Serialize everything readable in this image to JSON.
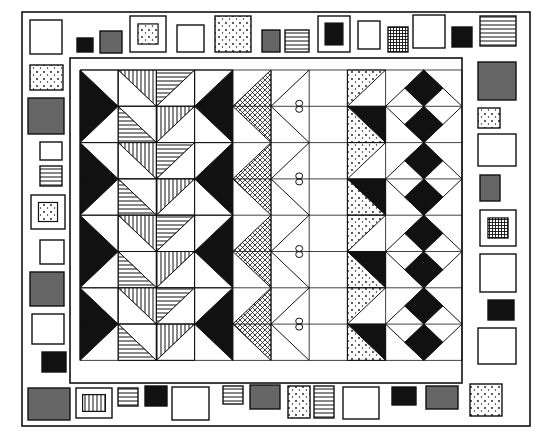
{
  "artwork": {
    "subject": "hand-drawn quilt illustration",
    "colors": {
      "ink": "#111111",
      "gray": "#666666",
      "paper": "#ffffff"
    },
    "border_patches": {
      "top": [
        {
          "x": 30,
          "y": 20,
          "w": 32,
          "h": 34,
          "fill": "white"
        },
        {
          "x": 77,
          "y": 38,
          "w": 16,
          "h": 14,
          "fill": "black"
        },
        {
          "x": 100,
          "y": 31,
          "w": 22,
          "h": 22,
          "fill": "gray"
        },
        {
          "x": 130,
          "y": 16,
          "w": 36,
          "h": 36,
          "fill": "white",
          "inner": "dots"
        },
        {
          "x": 177,
          "y": 25,
          "w": 27,
          "h": 27,
          "fill": "white"
        },
        {
          "x": 215,
          "y": 16,
          "w": 36,
          "h": 36,
          "fill": "dots"
        },
        {
          "x": 262,
          "y": 30,
          "w": 18,
          "h": 22,
          "fill": "gray"
        },
        {
          "x": 285,
          "y": 30,
          "w": 24,
          "h": 22,
          "fill": "hstripes"
        },
        {
          "x": 318,
          "y": 16,
          "w": 32,
          "h": 36,
          "fill": "white",
          "inner": "black"
        },
        {
          "x": 358,
          "y": 21,
          "w": 22,
          "h": 28,
          "fill": "white"
        },
        {
          "x": 388,
          "y": 27,
          "w": 20,
          "h": 25,
          "fill": "grid"
        },
        {
          "x": 413,
          "y": 15,
          "w": 32,
          "h": 33,
          "fill": "white"
        },
        {
          "x": 452,
          "y": 27,
          "w": 20,
          "h": 20,
          "fill": "black"
        },
        {
          "x": 480,
          "y": 16,
          "w": 36,
          "h": 30,
          "fill": "hstripes"
        }
      ],
      "left": [
        {
          "x": 30,
          "y": 65,
          "w": 33,
          "h": 25,
          "fill": "dots"
        },
        {
          "x": 28,
          "y": 98,
          "w": 36,
          "h": 36,
          "fill": "gray"
        },
        {
          "x": 40,
          "y": 142,
          "w": 22,
          "h": 18,
          "fill": "white"
        },
        {
          "x": 40,
          "y": 166,
          "w": 22,
          "h": 20,
          "fill": "hstripes"
        },
        {
          "x": 31,
          "y": 195,
          "w": 34,
          "h": 34,
          "fill": "white",
          "inner": "dots-gray"
        },
        {
          "x": 40,
          "y": 240,
          "w": 24,
          "h": 24,
          "fill": "white"
        },
        {
          "x": 30,
          "y": 272,
          "w": 34,
          "h": 34,
          "fill": "gray"
        },
        {
          "x": 32,
          "y": 314,
          "w": 32,
          "h": 30,
          "fill": "white"
        },
        {
          "x": 42,
          "y": 352,
          "w": 24,
          "h": 20,
          "fill": "black"
        }
      ],
      "right": [
        {
          "x": 478,
          "y": 62,
          "w": 38,
          "h": 38,
          "fill": "gray"
        },
        {
          "x": 478,
          "y": 108,
          "w": 22,
          "h": 20,
          "fill": "dots"
        },
        {
          "x": 478,
          "y": 134,
          "w": 38,
          "h": 32,
          "fill": "white"
        },
        {
          "x": 480,
          "y": 175,
          "w": 20,
          "h": 26,
          "fill": "gray"
        },
        {
          "x": 480,
          "y": 210,
          "w": 36,
          "h": 36,
          "fill": "white",
          "inner": "grid"
        },
        {
          "x": 480,
          "y": 254,
          "w": 36,
          "h": 38,
          "fill": "white"
        },
        {
          "x": 488,
          "y": 300,
          "w": 26,
          "h": 20,
          "fill": "black"
        },
        {
          "x": 478,
          "y": 328,
          "w": 38,
          "h": 36,
          "fill": "white"
        }
      ],
      "bottom": [
        {
          "x": 28,
          "y": 388,
          "w": 42,
          "h": 32,
          "fill": "gray"
        },
        {
          "x": 76,
          "y": 388,
          "w": 36,
          "h": 30,
          "fill": "white",
          "inner": "vstripes"
        },
        {
          "x": 118,
          "y": 388,
          "w": 20,
          "h": 18,
          "fill": "hstripes"
        },
        {
          "x": 145,
          "y": 386,
          "w": 22,
          "h": 20,
          "fill": "black"
        },
        {
          "x": 172,
          "y": 387,
          "w": 37,
          "h": 33,
          "fill": "white"
        },
        {
          "x": 223,
          "y": 386,
          "w": 20,
          "h": 18,
          "fill": "hstripes"
        },
        {
          "x": 250,
          "y": 385,
          "w": 30,
          "h": 24,
          "fill": "gray"
        },
        {
          "x": 288,
          "y": 386,
          "w": 22,
          "h": 32,
          "fill": "dots"
        },
        {
          "x": 314,
          "y": 386,
          "w": 20,
          "h": 32,
          "fill": "hstripes"
        },
        {
          "x": 343,
          "y": 387,
          "w": 36,
          "h": 32,
          "fill": "white"
        },
        {
          "x": 392,
          "y": 387,
          "w": 24,
          "h": 18,
          "fill": "black"
        },
        {
          "x": 426,
          "y": 386,
          "w": 32,
          "h": 23,
          "fill": "gray"
        },
        {
          "x": 470,
          "y": 384,
          "w": 32,
          "h": 32,
          "fill": "dots"
        }
      ]
    },
    "center_panel": {
      "frame": {
        "x": 70,
        "y": 58,
        "w": 392,
        "h": 325
      },
      "grid": {
        "x": 80,
        "y": 70,
        "cols": 10,
        "rows": 8,
        "col_w": 38.2,
        "row_h": 36.3
      },
      "columns": [
        {
          "name": "black-triangles-left"
        },
        {
          "name": "vertical-stripe-triangles"
        },
        {
          "name": "horizontal-stripe-triangles"
        },
        {
          "name": "black-triangles-right"
        },
        {
          "name": "crosshatch-zigzag"
        },
        {
          "name": "bow-zigzag"
        },
        {
          "name": "empty-column"
        },
        {
          "name": "dotted-black-triangles"
        },
        {
          "name": "black-diamonds-left"
        },
        {
          "name": "black-diamonds-right"
        }
      ]
    }
  }
}
